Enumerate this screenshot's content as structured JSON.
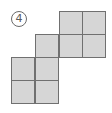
{
  "diagram": {
    "label": "4",
    "label_style": "circled-number",
    "cell_size_px": 23.5,
    "fill_color": "#d6d6d6",
    "border_color": "#707070",
    "cells": [
      {
        "row": 0,
        "col": 2
      },
      {
        "row": 0,
        "col": 3
      },
      {
        "row": 1,
        "col": 1
      },
      {
        "row": 1,
        "col": 2
      },
      {
        "row": 1,
        "col": 3
      },
      {
        "row": 2,
        "col": 0
      },
      {
        "row": 2,
        "col": 1
      },
      {
        "row": 3,
        "col": 0
      },
      {
        "row": 3,
        "col": 1
      }
    ]
  }
}
